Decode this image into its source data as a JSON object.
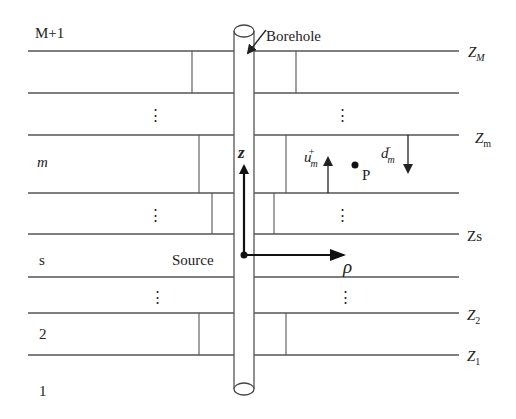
{
  "diagram": {
    "colors": {
      "line": "#555555",
      "text": "#222222",
      "background": "#ffffff"
    },
    "left_labels": {
      "top_layer": "M+1",
      "layer_m": "m",
      "layer_s": "s",
      "layer_2": "2",
      "layer_1": "1"
    },
    "right_labels": {
      "zM_base": "Z",
      "zM_sub": "M",
      "zm_base": "Z",
      "zm_sub": "m",
      "zs": "Zs",
      "z2_base": "Z",
      "z2_sub": "2",
      "z1_base": "Z",
      "z1_sub": "1"
    },
    "annotations": {
      "borehole": "Borehole",
      "source": "Source",
      "z_axis": "z",
      "rho_axis": "ρ",
      "point": "P",
      "u_base": "u",
      "u_sub": "m",
      "u_sup": "+",
      "d_base": "d",
      "d_sub": "m",
      "d_sup": "−",
      "ellipsis": "⋮"
    },
    "interfaces_y": [
      51,
      93,
      135,
      193,
      234,
      277,
      313,
      355
    ]
  }
}
